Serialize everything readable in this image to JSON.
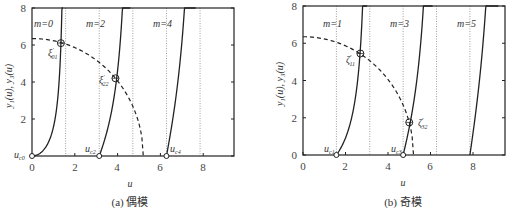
{
  "chart_data": [
    {
      "type": "line",
      "title": "",
      "caption": "(a) 偶模",
      "xlabel": "u",
      "ylabel": "y₁(u), y₃(u)",
      "xlim": [
        0,
        9.45
      ],
      "ylim": [
        0,
        8
      ],
      "xticks": [
        "0",
        "2",
        "4",
        "6",
        "8"
      ],
      "yticks": [
        "2",
        "4",
        "6",
        "8"
      ],
      "grid": false,
      "dotted_verticals": [
        1.571,
        3.142,
        4.712,
        6.283,
        7.854
      ],
      "series": [
        {
          "name": "m=0",
          "style": "solid",
          "function": "u*tan(u)",
          "u_range": [
            0,
            1.45
          ]
        },
        {
          "name": "m=2",
          "style": "solid",
          "function": "u*tan(u)",
          "u_range": [
            3.1416,
            4.6
          ]
        },
        {
          "name": "m=4",
          "style": "solid",
          "function": "u*tan(u)",
          "u_range": [
            6.2832,
            7.65
          ]
        },
        {
          "name": "circle",
          "style": "dashed",
          "function": "6.35*sqrt(1-(u/5.2)^2)",
          "u_range": [
            0,
            5.2
          ]
        }
      ],
      "mode_labels": [
        {
          "text": "m=0",
          "u": 0.05,
          "y": 7.2
        },
        {
          "text": "m=2",
          "u": 3.1,
          "y": 7.2
        },
        {
          "text": "m=4",
          "u": 6.2,
          "y": 7.2
        }
      ],
      "intersections": [
        {
          "label": "ξ′01",
          "u": 1.35,
          "y": 6.1
        },
        {
          "label": "ξ′22",
          "u": 3.9,
          "y": 4.2
        }
      ],
      "cutoffs": [
        {
          "label": "uc0",
          "u": 0.0
        },
        {
          "label": "uc2",
          "u": 3.1416
        },
        {
          "label": "uc4",
          "u": 6.2832
        }
      ]
    },
    {
      "type": "line",
      "title": "",
      "caption": "(b) 奇模",
      "xlabel": "u",
      "ylabel": "y₁(u), y₃(u)",
      "xlim": [
        0,
        9.5
      ],
      "ylim": [
        0,
        8
      ],
      "xticks": [
        "0",
        "2",
        "4",
        "6",
        "8"
      ],
      "yticks": [
        "0",
        "2",
        "4",
        "6",
        "8"
      ],
      "grid": false,
      "dotted_verticals": [
        1.571,
        3.142,
        4.712,
        6.283,
        7.854
      ],
      "series": [
        {
          "name": "m=1",
          "style": "solid",
          "function": "-u/tan(u)",
          "u_range": [
            1.5708,
            3.02
          ]
        },
        {
          "name": "m=3",
          "style": "solid",
          "function": "-u/tan(u)",
          "u_range": [
            4.7124,
            6.1
          ]
        },
        {
          "name": "m=5",
          "style": "solid",
          "function": "-u/tan(u)",
          "u_range": [
            7.854,
            9.2
          ]
        },
        {
          "name": "circle",
          "style": "dashed",
          "function": "6.35*sqrt(1-(u/5.2)^2)",
          "u_range": [
            0,
            5.2
          ]
        }
      ],
      "mode_labels": [
        {
          "text": "m=1",
          "u": 1.3,
          "y": 7.2
        },
        {
          "text": "m=3",
          "u": 4.85,
          "y": 7.2
        },
        {
          "text": "m=5",
          "u": 7.75,
          "y": 7.2
        }
      ],
      "intersections": [
        {
          "label": "ζ′11",
          "u": 2.7,
          "y": 5.45
        },
        {
          "label": "ζ′32",
          "u": 5.0,
          "y": 1.75
        }
      ],
      "cutoffs": [
        {
          "label": "uc1",
          "u": 1.5708
        },
        {
          "label": "uc3",
          "u": 4.7124
        }
      ]
    }
  ],
  "labels": {
    "left": {
      "ylabel": "y₁(u), y₃(u)",
      "xlabel": "u",
      "caption": "(a) 偶模",
      "ticks_x": [
        "0",
        "2",
        "4",
        "6",
        "8"
      ],
      "ticks_y": [
        "2",
        "4",
        "6",
        "8"
      ],
      "m0": "m=0",
      "m2": "m=2",
      "m4": "m=4",
      "xi01": "ξ",
      "xi01_sup": "′",
      "xi01_sub": "01",
      "xi22": "ξ",
      "xi22_sup": "′",
      "xi22_sub": "22",
      "uc0": "u",
      "uc0_sub": "c0",
      "uc2": "u",
      "uc2_sub": "c2",
      "uc4": "u",
      "uc4_sub": "c4"
    },
    "right": {
      "ylabel": "y₁(u), y₃(u)",
      "xlabel": "u",
      "caption": "(b) 奇模",
      "ticks_x": [
        "0",
        "2",
        "4",
        "6",
        "8"
      ],
      "ticks_y": [
        "0",
        "2",
        "4",
        "6",
        "8"
      ],
      "m1": "m=1",
      "m3": "m=3",
      "m5": "m=5",
      "z11": "ζ",
      "z11_sup": "′",
      "z11_sub": "11",
      "z32": "ζ",
      "z32_sup": "′",
      "z32_sub": "32",
      "uc1": "u",
      "uc1_sub": "c1",
      "uc3": "u",
      "uc3_sub": "c3"
    }
  }
}
